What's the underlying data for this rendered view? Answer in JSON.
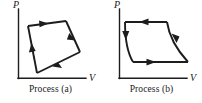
{
  "figure": {
    "type": "pv-diagram-pair",
    "background_color": "#ffffff",
    "stroke_color": "#1d1d1d",
    "panels": [
      {
        "id": "a",
        "caption": "Process (a)",
        "axes": {
          "y_label": "P",
          "x_label": "V",
          "origin": {
            "x": 18,
            "y": 78
          },
          "y_top": 8,
          "x_right": 86
        },
        "path_shape": "quadrilateral",
        "vertices": [
          {
            "name": "bottom",
            "x": 37,
            "y": 73
          },
          {
            "name": "upper-left",
            "x": 28,
            "y": 26
          },
          {
            "name": "top-right",
            "x": 66,
            "y": 21
          },
          {
            "name": "right",
            "x": 80,
            "y": 52
          }
        ],
        "direction": "counterclockwise",
        "arrows": [
          {
            "on_segment": "bottom-to-upper-left",
            "points": "up"
          },
          {
            "on_segment": "upper-left-to-top-right",
            "points": "right"
          },
          {
            "on_segment": "top-right-to-right",
            "points": "down-right"
          },
          {
            "on_segment": "right-to-bottom",
            "points": "left"
          }
        ]
      },
      {
        "id": "b",
        "caption": "Process (b)",
        "axes": {
          "y_label": "P",
          "x_label": "V",
          "origin": {
            "x": 18,
            "y": 78
          },
          "y_top": 8,
          "x_right": 86
        },
        "path_shape": "curved-quadrilateral",
        "vertices": [
          {
            "name": "top-left",
            "x": 24,
            "y": 22
          },
          {
            "name": "top-right",
            "x": 66,
            "y": 22
          },
          {
            "name": "bottom-right",
            "x": 87,
            "y": 62
          },
          {
            "name": "bottom-left",
            "x": 32,
            "y": 62
          }
        ],
        "curved_sides": [
          "left",
          "right"
        ],
        "straight_sides": [
          "top",
          "bottom"
        ],
        "direction": "counterclockwise",
        "arrows": [
          {
            "on_segment": "top-right-to-top-left",
            "points": "left"
          },
          {
            "on_segment": "left-curve-downward",
            "points": "down"
          },
          {
            "on_segment": "bottom-left-to-bottom-right",
            "points": "right"
          },
          {
            "on_segment": "right-curve-upward",
            "points": "up-left"
          }
        ]
      }
    ]
  }
}
